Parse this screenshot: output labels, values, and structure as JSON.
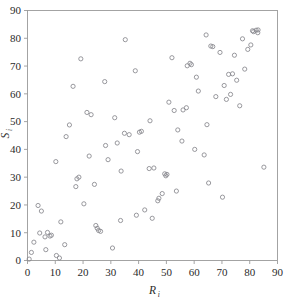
{
  "chart_data": {
    "type": "scatter",
    "title": "",
    "subtitle": "",
    "xlabel": "R",
    "xlabel_sub": "i",
    "ylabel": "S",
    "ylabel_sub": "i",
    "xlim": [
      0,
      90
    ],
    "ylim": [
      0,
      90
    ],
    "xticks": [
      0,
      10,
      20,
      30,
      40,
      50,
      60,
      70,
      80,
      90
    ],
    "yticks": [
      0,
      10,
      20,
      30,
      40,
      50,
      60,
      70,
      80,
      90
    ],
    "xtick_labels": [
      "0",
      "10",
      "20",
      "30",
      "40",
      "50",
      "60",
      "70",
      "80",
      "90"
    ],
    "ytick_labels": [
      "0",
      "10",
      "20",
      "30",
      "40",
      "50",
      "60",
      "70",
      "80",
      "90"
    ],
    "grid": false,
    "legend": null,
    "marker": "open-circle",
    "marker_color": "#86868c",
    "marker_radius_px": 2.1,
    "frame_color": "#9a9a9a",
    "background": "#ffffff",
    "n_points": 100,
    "points": [
      [
        0.6,
        0.5
      ],
      [
        1.4,
        2.9
      ],
      [
        2.3,
        6.6
      ],
      [
        3.8,
        19.8
      ],
      [
        4.4,
        9.9
      ],
      [
        5.0,
        17.8
      ],
      [
        6.3,
        8.5
      ],
      [
        6.6,
        3.9
      ],
      [
        8.1,
        8.8
      ],
      [
        8.6,
        9.1
      ],
      [
        10.4,
        1.8
      ],
      [
        10.2,
        35.6
      ],
      [
        12.0,
        13.9
      ],
      [
        13.4,
        5.7
      ],
      [
        13.9,
        44.6
      ],
      [
        15.1,
        48.8
      ],
      [
        16.4,
        62.7
      ],
      [
        17.4,
        26.6
      ],
      [
        17.8,
        29.4
      ],
      [
        19.2,
        72.6
      ],
      [
        20.3,
        20.4
      ],
      [
        21.4,
        53.3
      ],
      [
        22.2,
        37.6
      ],
      [
        22.9,
        52.5
      ],
      [
        24.1,
        27.4
      ],
      [
        24.6,
        12.6
      ],
      [
        25.1,
        11.6
      ],
      [
        25.6,
        10.8
      ],
      [
        27.8,
        64.4
      ],
      [
        29.0,
        36.3
      ],
      [
        28.1,
        41.4
      ],
      [
        30.6,
        4.5
      ],
      [
        31.4,
        51.4
      ],
      [
        32.3,
        42.3
      ],
      [
        33.5,
        14.4
      ],
      [
        33.7,
        32.2
      ],
      [
        35.2,
        79.5
      ],
      [
        36.6,
        45.3
      ],
      [
        38.8,
        68.3
      ],
      [
        39.2,
        16.3
      ],
      [
        39.6,
        39.2
      ],
      [
        40.3,
        46.2
      ],
      [
        42.2,
        18.2
      ],
      [
        43.8,
        33.1
      ],
      [
        44.1,
        50.3
      ],
      [
        44.9,
        15.2
      ],
      [
        46.9,
        21.5
      ],
      [
        47.3,
        22.4
      ],
      [
        48.5,
        24.1
      ],
      [
        49.4,
        31.2
      ],
      [
        49.8,
        30.5
      ],
      [
        50.9,
        57.0
      ],
      [
        52.0,
        73.0
      ],
      [
        52.8,
        54.0
      ],
      [
        53.6,
        25.0
      ],
      [
        54.1,
        47.0
      ],
      [
        55.6,
        43.0
      ],
      [
        57.2,
        55.0
      ],
      [
        57.5,
        70.1
      ],
      [
        58.5,
        71.0
      ],
      [
        60.2,
        40.0
      ],
      [
        60.8,
        66.0
      ],
      [
        61.5,
        61.0
      ],
      [
        63.6,
        38.0
      ],
      [
        64.3,
        81.2
      ],
      [
        64.6,
        48.9
      ],
      [
        65.2,
        27.9
      ],
      [
        66.7,
        77.0
      ],
      [
        67.8,
        59.0
      ],
      [
        69.3,
        74.9
      ],
      [
        70.2,
        22.8
      ],
      [
        70.8,
        63.0
      ],
      [
        71.6,
        58.0
      ],
      [
        72.4,
        67.0
      ],
      [
        73.1,
        59.8
      ],
      [
        74.5,
        73.9
      ],
      [
        75.3,
        64.9
      ],
      [
        76.4,
        55.7
      ],
      [
        77.4,
        79.8
      ],
      [
        78.2,
        68.9
      ],
      [
        79.3,
        76.0
      ],
      [
        80.4,
        77.6
      ],
      [
        81.4,
        82.4
      ],
      [
        82.3,
        82.9
      ],
      [
        82.9,
        82.0
      ],
      [
        85.1,
        33.6
      ],
      [
        7.2,
        10.1
      ],
      [
        11.5,
        0.9
      ],
      [
        18.5,
        30.0
      ],
      [
        26.3,
        10.5
      ],
      [
        34.9,
        45.8
      ],
      [
        41.0,
        46.5
      ],
      [
        45.5,
        33.3
      ],
      [
        50.2,
        31.0
      ],
      [
        56.0,
        54.2
      ],
      [
        59.0,
        70.5
      ],
      [
        66.0,
        77.2
      ],
      [
        73.8,
        67.2
      ],
      [
        81.0,
        82.7
      ],
      [
        83.0,
        83.0
      ]
    ]
  }
}
